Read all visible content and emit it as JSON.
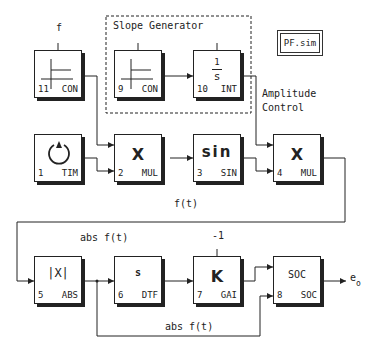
{
  "diagram": {
    "file_label": "PF.sim",
    "group": {
      "title": "Slope Generator"
    },
    "annotations": {
      "f_input": "f",
      "amplitude_control_line1": "Amplitude",
      "amplitude_control_line2": "Control",
      "ft": "f(t)",
      "abs_ft_top": "abs f(t)",
      "abs_ft_bottom": "abs f(t)",
      "gain_param": "-1",
      "output_main": "e",
      "output_sub": "o"
    },
    "blocks": [
      {
        "id": "11",
        "type": "CON",
        "symbol": "const-plot"
      },
      {
        "id": "9",
        "type": "CON",
        "symbol": "const-plot"
      },
      {
        "id": "10",
        "type": "INT",
        "symbol_num": "1",
        "symbol_den": "s"
      },
      {
        "id": "1",
        "type": "TIM",
        "symbol": "clock"
      },
      {
        "id": "2",
        "type": "MUL",
        "symbol": "X"
      },
      {
        "id": "3",
        "type": "SIN",
        "symbol": "sin"
      },
      {
        "id": "4",
        "type": "MUL",
        "symbol": "X"
      },
      {
        "id": "5",
        "type": "ABS",
        "symbol": "|X|"
      },
      {
        "id": "6",
        "type": "DTF",
        "symbol": "s"
      },
      {
        "id": "7",
        "type": "GAI",
        "symbol": "K"
      },
      {
        "id": "8",
        "type": "SOC",
        "symbol": "SOC"
      }
    ],
    "colors": {
      "line": "#222222",
      "background": "#ffffff"
    }
  }
}
